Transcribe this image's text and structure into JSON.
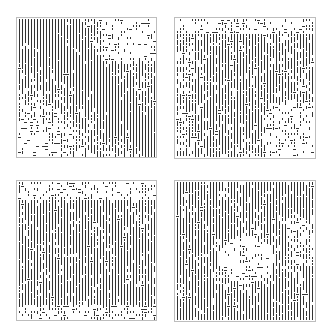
{
  "figure": {
    "ink_color": "#333333",
    "border_color": "#bdbdbd",
    "panels": [
      {
        "id": "top-left",
        "x": 16,
        "y": 17,
        "size": 141,
        "pattern": "diagonal-band-dense-lower-right",
        "seed": 11
      },
      {
        "id": "top-right",
        "x": 174,
        "y": 17,
        "size": 142,
        "pattern": "diagonal-band-dense-center-left",
        "seed": 23
      },
      {
        "id": "bottom-left",
        "x": 16,
        "y": 180,
        "size": 141,
        "pattern": "dense-middle-sparse-top-bottom",
        "seed": 37
      },
      {
        "id": "bottom-right",
        "x": 174,
        "y": 180,
        "size": 142,
        "pattern": "dense-with-sparse-center-hole",
        "seed": 53
      }
    ]
  }
}
